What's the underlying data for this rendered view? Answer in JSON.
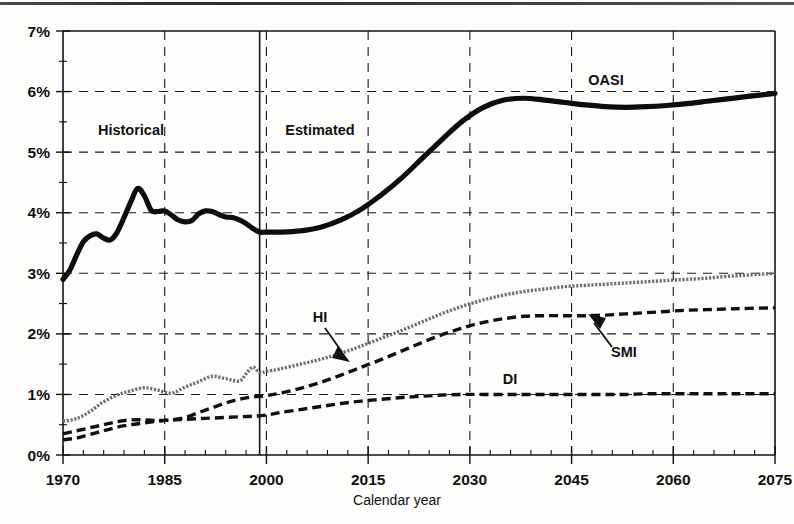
{
  "figure": {
    "background": "#fdfdfc",
    "ink": "#111111",
    "hi_series_color": "#6f6f6f"
  },
  "annotations": {
    "historical": "Historical",
    "estimated": "Estimated",
    "oasi": "OASI",
    "hi": "HI",
    "di": "DI",
    "smi": "SMI"
  },
  "chart_data": {
    "type": "line",
    "title": "",
    "xlabel": "Calendar year",
    "ylabel": "",
    "xlim": [
      1970,
      2075
    ],
    "ylim": [
      0,
      7
    ],
    "grid": true,
    "legend": "inline-annotations",
    "xticks": [
      "1970",
      "1985",
      "2000",
      "2015",
      "2030",
      "2045",
      "2060",
      "2075"
    ],
    "xtick_values": [
      1970,
      1985,
      2000,
      2015,
      2030,
      2045,
      2060,
      2075
    ],
    "xminor_step": 3,
    "yticks": [
      "0%",
      "1%",
      "2%",
      "3%",
      "4%",
      "5%",
      "6%",
      "7%"
    ],
    "ytick_values": [
      0,
      1,
      2,
      3,
      4,
      5,
      6,
      7
    ],
    "yminor_step": 0.5,
    "ytick_unit": "%",
    "projection_divider_year": 1999,
    "regions": [
      {
        "label": "Historical",
        "from": 1970,
        "to": 1999
      },
      {
        "label": "Estimated",
        "from": 1999,
        "to": 2075
      }
    ],
    "series": [
      {
        "name": "OASI",
        "style": "solid-thick",
        "color": "#0d0d0d",
        "x": [
          1970,
          1971,
          1972,
          1973,
          1974,
          1975,
          1976,
          1977,
          1978,
          1979,
          1980,
          1981,
          1982,
          1983,
          1984,
          1985,
          1986,
          1987,
          1988,
          1989,
          1990,
          1991,
          1992,
          1993,
          1994,
          1995,
          1996,
          1997,
          1998,
          1999,
          2000,
          2002,
          2005,
          2008,
          2011,
          2014,
          2017,
          2020,
          2023,
          2026,
          2029,
          2032,
          2035,
          2038,
          2041,
          2044,
          2047,
          2050,
          2053,
          2056,
          2059,
          2062,
          2065,
          2068,
          2071,
          2075
        ],
        "values": [
          2.9,
          3.05,
          3.3,
          3.52,
          3.62,
          3.65,
          3.58,
          3.55,
          3.68,
          3.92,
          4.18,
          4.4,
          4.28,
          4.04,
          4.02,
          4.03,
          3.96,
          3.88,
          3.85,
          3.87,
          3.98,
          4.03,
          4.02,
          3.97,
          3.93,
          3.92,
          3.88,
          3.82,
          3.74,
          3.68,
          3.68,
          3.68,
          3.7,
          3.76,
          3.88,
          4.06,
          4.3,
          4.58,
          4.9,
          5.22,
          5.52,
          5.74,
          5.86,
          5.89,
          5.86,
          5.82,
          5.78,
          5.75,
          5.74,
          5.75,
          5.77,
          5.8,
          5.84,
          5.88,
          5.92,
          5.97
        ]
      },
      {
        "name": "HI",
        "style": "fine-dotted",
        "color": "#6f6f6f",
        "x": [
          1970,
          1972,
          1974,
          1976,
          1978,
          1980,
          1982,
          1984,
          1986,
          1988,
          1990,
          1992,
          1994,
          1996,
          1997,
          1998,
          1999,
          2000,
          2002,
          2005,
          2008,
          2011,
          2014,
          2017,
          2020,
          2023,
          2026,
          2029,
          2032,
          2035,
          2038,
          2041,
          2044,
          2047,
          2050,
          2053,
          2056,
          2059,
          2062,
          2065,
          2068,
          2071,
          2075
        ],
        "values": [
          0.56,
          0.6,
          0.72,
          0.88,
          0.99,
          1.06,
          1.11,
          1.07,
          1.02,
          1.12,
          1.21,
          1.3,
          1.26,
          1.22,
          1.34,
          1.45,
          1.36,
          1.38,
          1.42,
          1.5,
          1.58,
          1.68,
          1.8,
          1.93,
          2.06,
          2.2,
          2.34,
          2.46,
          2.56,
          2.64,
          2.7,
          2.74,
          2.78,
          2.8,
          2.82,
          2.84,
          2.86,
          2.88,
          2.9,
          2.92,
          2.95,
          2.97,
          3.0
        ]
      },
      {
        "name": "SMI",
        "style": "dashed",
        "color": "#101010",
        "x": [
          1970,
          1972,
          1974,
          1976,
          1978,
          1980,
          1982,
          1984,
          1986,
          1988,
          1990,
          1992,
          1994,
          1996,
          1998,
          2000,
          2002,
          2005,
          2008,
          2011,
          2014,
          2017,
          2020,
          2023,
          2026,
          2029,
          2032,
          2035,
          2038,
          2041,
          2044,
          2047,
          2050,
          2053,
          2056,
          2059,
          2062,
          2065,
          2068,
          2071,
          2075
        ],
        "values": [
          0.35,
          0.4,
          0.45,
          0.5,
          0.55,
          0.58,
          0.58,
          0.57,
          0.58,
          0.62,
          0.7,
          0.78,
          0.86,
          0.92,
          0.96,
          0.98,
          1.02,
          1.1,
          1.2,
          1.32,
          1.45,
          1.58,
          1.72,
          1.86,
          1.99,
          2.1,
          2.19,
          2.25,
          2.29,
          2.3,
          2.3,
          2.3,
          2.31,
          2.33,
          2.35,
          2.37,
          2.39,
          2.4,
          2.41,
          2.42,
          2.43
        ]
      },
      {
        "name": "DI",
        "style": "dashed",
        "color": "#101010",
        "x": [
          1970,
          1972,
          1974,
          1976,
          1978,
          1980,
          1982,
          1984,
          1986,
          1988,
          1990,
          1992,
          1994,
          1996,
          1998,
          2000,
          2002,
          2005,
          2008,
          2011,
          2014,
          2017,
          2020,
          2023,
          2026,
          2029,
          2032,
          2035,
          2038,
          2041,
          2044,
          2047,
          2050,
          2053,
          2056,
          2059,
          2062,
          2065,
          2068,
          2071,
          2075
        ],
        "values": [
          0.25,
          0.28,
          0.34,
          0.4,
          0.46,
          0.5,
          0.53,
          0.56,
          0.58,
          0.59,
          0.6,
          0.61,
          0.62,
          0.63,
          0.64,
          0.66,
          0.7,
          0.75,
          0.8,
          0.85,
          0.89,
          0.92,
          0.95,
          0.97,
          0.99,
          1.0,
          1.0,
          1.0,
          1.0,
          1.0,
          1.0,
          1.0,
          1.0,
          1.0,
          1.01,
          1.01,
          1.01,
          1.01,
          1.01,
          1.01,
          1.01
        ]
      }
    ]
  }
}
